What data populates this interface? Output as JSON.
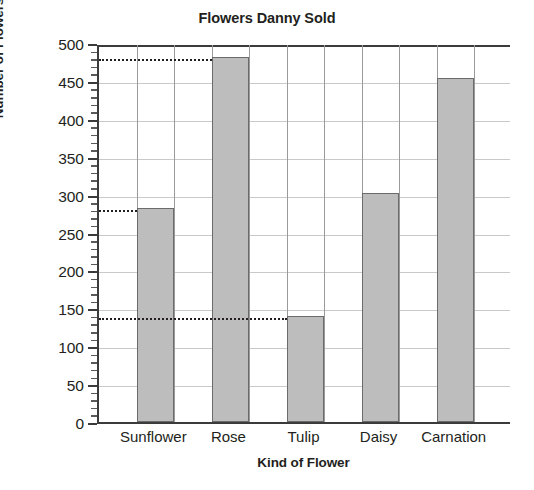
{
  "chart_data": {
    "type": "bar",
    "title": "Flowers Danny Sold",
    "xlabel": "Kind of Flower",
    "ylabel": "Number of Flowers",
    "categories": [
      "Sunflower",
      "Rose",
      "Tulip",
      "Daisy",
      "Carnation"
    ],
    "values": [
      282,
      481,
      140,
      302,
      454
    ],
    "ylim": [
      0,
      500
    ],
    "ytick_step": 50,
    "yticks": [
      0,
      50,
      100,
      150,
      200,
      250,
      300,
      350,
      400,
      450,
      500
    ],
    "ytick_labels": [
      "0",
      "50",
      "100",
      "150",
      "200",
      "250",
      "300",
      "350",
      "400",
      "450",
      "500"
    ],
    "minor_tick_step": 10,
    "grid": {
      "horizontal": true,
      "vertical": true
    },
    "legend": null,
    "annotations": [
      {
        "type": "reference-line",
        "style": "dotted",
        "value": 481,
        "to_category": "Rose"
      },
      {
        "type": "reference-line",
        "style": "dotted",
        "value": 282,
        "to_category": "Sunflower"
      },
      {
        "type": "reference-line",
        "style": "dotted",
        "value": 140,
        "to_category": "Tulip"
      }
    ],
    "colors": {
      "bar_fill": "#BDBDBD",
      "bar_edge": "#6B6B6B",
      "axis": "#3B3B3B",
      "grid": "#C9C9C9",
      "text": "#231F20",
      "background": "#FFFFFF"
    }
  }
}
